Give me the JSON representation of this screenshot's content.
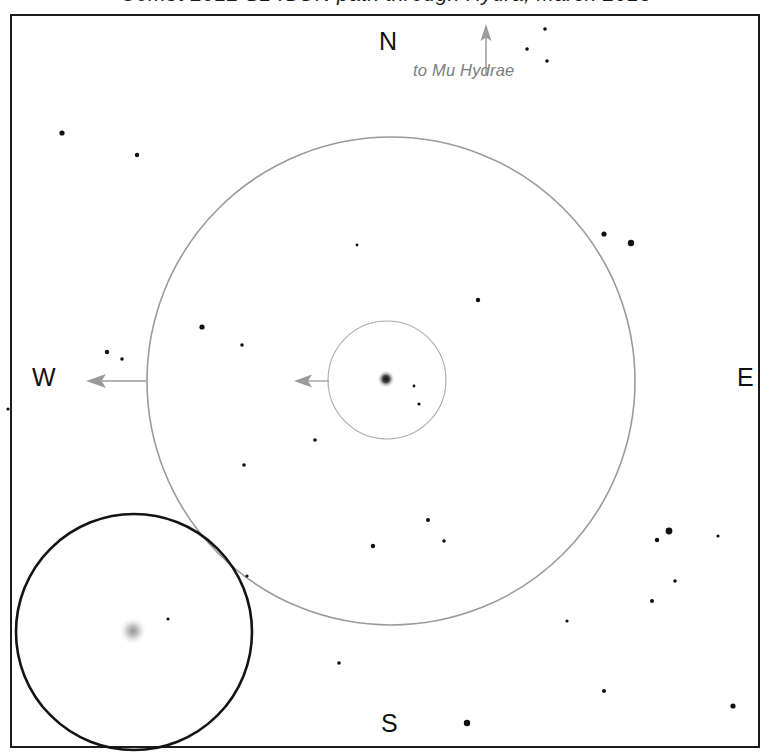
{
  "title": {
    "text": "Comet 2012 S1 ISON path through Hydra, March 2013",
    "visible": "clipped"
  },
  "frame": {
    "border_color": "#1b1b1b",
    "background": "#ffffff"
  },
  "compass": {
    "north": "N",
    "south": "S",
    "east": "E",
    "west": "W"
  },
  "annotations": [
    {
      "name": "motion-label",
      "text": "to Mu Hydrae",
      "color": "#7d7d7d",
      "style": "italic"
    }
  ],
  "arrows": [
    {
      "name": "north-direction-arrow",
      "x1": 486,
      "y1": 72,
      "x2": 486,
      "y2": 30,
      "color": "#9a9a9a",
      "head": "up"
    },
    {
      "name": "outer-halo-motion-arrow",
      "x1": 146,
      "y1": 381,
      "x2": 88,
      "y2": 381,
      "color": "#9a9a9a",
      "head": "left"
    },
    {
      "name": "inner-coma-motion-arrow",
      "x1": 328,
      "y1": 381,
      "x2": 295,
      "y2": 381,
      "color": "#9a9a9a",
      "head": "left"
    }
  ],
  "circles": [
    {
      "name": "outer-halo-circle",
      "cx": 391,
      "cy": 381,
      "r": 244,
      "stroke": "#9a9a9a",
      "stroke_width": 1.6,
      "fill": "none"
    },
    {
      "name": "inner-coma-circle",
      "cx": 387,
      "cy": 380,
      "r": 59,
      "stroke": "#aaaaaa",
      "stroke_width": 1.1,
      "fill": "none"
    },
    {
      "name": "inset-eyepiece-circle",
      "cx": 134,
      "cy": 632,
      "r": 118,
      "stroke": "#141414",
      "stroke_width": 2.6,
      "fill": "none"
    }
  ],
  "fuzzy_objects": [
    {
      "name": "comet-nucleus",
      "cx": 386,
      "cy": 379,
      "r": 7,
      "color": "#141414",
      "label": "comet core in main field"
    },
    {
      "name": "comet-nucleus-inset",
      "cx": 133,
      "cy": 631,
      "r": 11,
      "color": "#9c9c9c",
      "label": "comet core in eyepiece inset"
    }
  ],
  "chart_data": {
    "type": "scatter",
    "title": "Comet 2012 S1 ISON path through Hydra, March 2013",
    "xlabel": "",
    "ylabel": "",
    "grid": false,
    "legend": "none",
    "axis_orientation": {
      "up": "N",
      "down": "S",
      "left": "W",
      "right": "E"
    },
    "series": [
      {
        "name": "field stars",
        "points": [
          {
            "x": 62,
            "y": 133,
            "mag": 2.6
          },
          {
            "x": 137,
            "y": 155,
            "mag": 2.2
          },
          {
            "x": 545,
            "y": 29,
            "mag": 1.8
          },
          {
            "x": 527,
            "y": 49,
            "mag": 1.8
          },
          {
            "x": 547,
            "y": 61,
            "mag": 1.8
          },
          {
            "x": 604,
            "y": 234,
            "mag": 2.6
          },
          {
            "x": 631,
            "y": 243,
            "mag": 3.2
          },
          {
            "x": 478,
            "y": 300,
            "mag": 2.2
          },
          {
            "x": 202,
            "y": 327,
            "mag": 2.6
          },
          {
            "x": 242,
            "y": 345,
            "mag": 1.8
          },
          {
            "x": 107,
            "y": 352,
            "mag": 2.2
          },
          {
            "x": 122,
            "y": 359,
            "mag": 1.8
          },
          {
            "x": 8,
            "y": 409,
            "mag": 1.6
          },
          {
            "x": 315,
            "y": 440,
            "mag": 1.8
          },
          {
            "x": 244,
            "y": 465,
            "mag": 1.8
          },
          {
            "x": 419,
            "y": 404,
            "mag": 1.6
          },
          {
            "x": 428,
            "y": 520,
            "mag": 2.0
          },
          {
            "x": 373,
            "y": 546,
            "mag": 2.2
          },
          {
            "x": 444,
            "y": 541,
            "mag": 1.8
          },
          {
            "x": 168,
            "y": 619,
            "mag": 1.6
          },
          {
            "x": 669,
            "y": 531,
            "mag": 3.4
          },
          {
            "x": 657,
            "y": 540,
            "mag": 2.2
          },
          {
            "x": 718,
            "y": 536,
            "mag": 1.6
          },
          {
            "x": 675,
            "y": 581,
            "mag": 1.8
          },
          {
            "x": 652,
            "y": 601,
            "mag": 2.0
          },
          {
            "x": 567,
            "y": 621,
            "mag": 1.6
          },
          {
            "x": 604,
            "y": 691,
            "mag": 2.0
          },
          {
            "x": 733,
            "y": 706,
            "mag": 2.6
          },
          {
            "x": 339,
            "y": 663,
            "mag": 1.8
          },
          {
            "x": 467,
            "y": 723,
            "mag": 3.2
          },
          {
            "x": 247,
            "y": 576,
            "mag": 1.6
          },
          {
            "x": 357,
            "y": 245,
            "mag": 1.4
          },
          {
            "x": 414,
            "y": 386,
            "mag": 1.4
          }
        ]
      }
    ]
  }
}
